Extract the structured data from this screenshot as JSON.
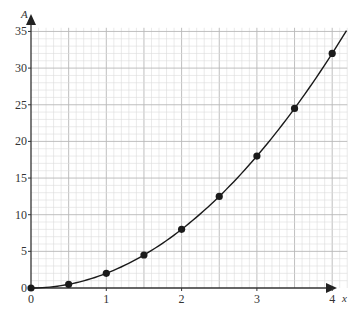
{
  "chart_data": {
    "type": "line",
    "title": "",
    "xlabel": "x",
    "ylabel": "A",
    "xlim": [
      0,
      4.2
    ],
    "ylim": [
      0,
      35.5
    ],
    "x_ticks": [
      "0",
      "1",
      "2",
      "3",
      "4"
    ],
    "y_ticks": [
      "0",
      "5",
      "10",
      "15",
      "20",
      "25",
      "30",
      "35"
    ],
    "grid": true,
    "legend": null,
    "series": [
      {
        "name": "A = 2x^2",
        "style": "smooth curve with markers",
        "color": "#1a1a1a",
        "x": [
          0,
          0.5,
          1,
          1.5,
          2,
          2.5,
          3,
          3.5,
          4
        ],
        "values": [
          0,
          0.5,
          2,
          4.5,
          8,
          12.5,
          18,
          24.5,
          32
        ]
      }
    ]
  },
  "colors": {
    "grid_minor": "#dcdcdc",
    "grid_major": "#b8b8b8",
    "axis": "#333333",
    "curve": "#1a1a1a"
  }
}
